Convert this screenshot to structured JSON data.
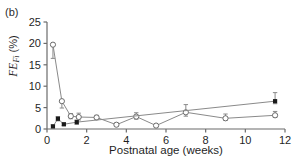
{
  "figure": {
    "panel_label": "(b)",
    "background": "#ffffff",
    "axis_color": "#6b6b6b",
    "line_color": "#8a8a8a",
    "open_marker_fill": "#ffffff",
    "open_marker_stroke": "#6b6b6b",
    "filled_marker_fill": "#1a1a1a"
  },
  "chart_data": {
    "type": "line",
    "title": "",
    "xlabel": "Postnatal age (weeks)",
    "ylabel": "FE_Fi (%)",
    "ylabel_parts": {
      "italic": "FE",
      "subscript": "Fi",
      "units": " (%)"
    },
    "xlim": [
      0,
      12
    ],
    "ylim": [
      0,
      25
    ],
    "xticks": [
      0,
      2,
      4,
      6,
      8,
      10,
      12
    ],
    "yticks": [
      0,
      5,
      10,
      15,
      20,
      25
    ],
    "xtick_labels": [
      "0",
      "2",
      "4",
      "6",
      "8",
      "10",
      "12"
    ],
    "ytick_labels": [
      "0",
      "5",
      "10",
      "15",
      "20",
      "25"
    ],
    "grid": false,
    "legend": "none",
    "series": [
      {
        "name": "open-circle-series",
        "marker": "open-circle",
        "connected": true,
        "errorbars": true,
        "points": [
          {
            "x": 0.3,
            "y": 19.7,
            "err_low": 3.2,
            "err_high": 0.0
          },
          {
            "x": 0.75,
            "y": 6.5,
            "err_low": 1.6,
            "err_high": 0.0
          },
          {
            "x": 1.2,
            "y": 3.0,
            "err_low": 0.6,
            "err_high": 0.6
          },
          {
            "x": 1.6,
            "y": 2.8,
            "err_low": 0.7,
            "err_high": 0.9
          },
          {
            "x": 2.5,
            "y": 2.7,
            "err_low": 0.5,
            "err_high": 0.5
          },
          {
            "x": 3.5,
            "y": 1.0,
            "err_low": 0.4,
            "err_high": 0.4
          },
          {
            "x": 4.5,
            "y": 2.9,
            "err_low": 0.6,
            "err_high": 0.9
          },
          {
            "x": 5.5,
            "y": 0.8,
            "err_low": 0.3,
            "err_high": 0.3
          },
          {
            "x": 7.0,
            "y": 3.9,
            "err_low": 0.9,
            "err_high": 1.8
          },
          {
            "x": 9.0,
            "y": 2.5,
            "err_low": 0.5,
            "err_high": 1.0
          },
          {
            "x": 11.5,
            "y": 3.2,
            "err_low": 0.5,
            "err_high": 0.9
          }
        ]
      },
      {
        "name": "filled-square-series",
        "marker": "filled-square",
        "connected": true,
        "errorbars": true,
        "points": [
          {
            "x": 0.3,
            "y": 0.6,
            "err_low": 0.0,
            "err_high": 0.4
          },
          {
            "x": 0.55,
            "y": 2.4,
            "err_low": 0.5,
            "err_high": 0.5
          },
          {
            "x": 0.85,
            "y": 1.1,
            "err_low": 0.3,
            "err_high": 0.3
          },
          {
            "x": 1.5,
            "y": 1.6,
            "err_low": 0.5,
            "err_high": 0.5
          },
          {
            "x": 11.5,
            "y": 6.5,
            "err_low": 0.6,
            "err_high": 2.0
          }
        ]
      }
    ]
  }
}
